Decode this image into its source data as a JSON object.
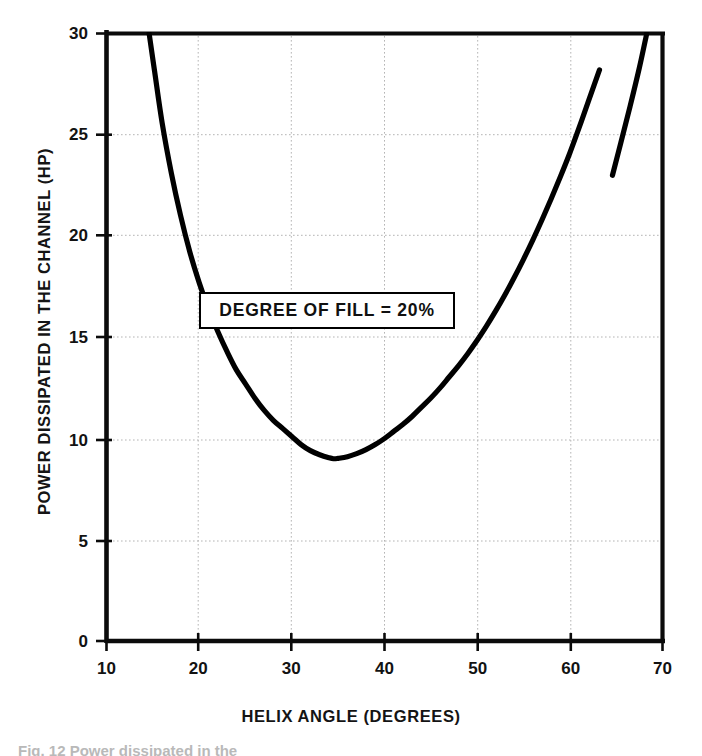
{
  "figure": {
    "caption_partial": "Fig. 12   Power dissipated in the"
  },
  "chart_data": {
    "type": "line",
    "title": "",
    "subtitle": "",
    "xlabel": "HELIX  ANGLE  (DEGREES)",
    "ylabel": "POWER DISSIPATED IN THE CHANNEL  (HP)",
    "xlim": [
      10,
      70
    ],
    "ylim": [
      0,
      30
    ],
    "xticks": [
      10,
      20,
      30,
      40,
      50,
      60,
      70
    ],
    "yticks": [
      0,
      5,
      10,
      15,
      20,
      25,
      30
    ],
    "xtick_labels": [
      "10",
      "20",
      "30",
      "40",
      "50",
      "60",
      "70"
    ],
    "ytick_labels": [
      "0",
      "5",
      "10",
      "15",
      "20",
      "25",
      "30"
    ],
    "grid": true,
    "grid_style": "dotted",
    "legend": null,
    "annotations": [
      {
        "text": "DEGREE OF FILL = 20%",
        "x": 34.5,
        "y": 16.3,
        "boxed": true
      }
    ],
    "series": [
      {
        "name": "Power dissipated (degree of fill 20%)",
        "color": "#000000",
        "line_width": 4,
        "has_break": true,
        "break_x_range": [
          63.2,
          64.6
        ],
        "x": [
          14.6,
          15.2,
          16.0,
          17.0,
          18.0,
          19.0,
          20.0,
          21.0,
          22.0,
          23.0,
          24.0,
          25.0,
          26.0,
          27.0,
          28.0,
          29.0,
          30.0,
          31.0,
          32.0,
          33.0,
          34.0,
          34.5,
          35.0,
          36.0,
          37.0,
          38.0,
          39.0,
          40.0,
          41.0,
          42.0,
          43.0,
          44.0,
          45.0,
          46.0,
          47.0,
          48.0,
          49.0,
          50.0,
          51.0,
          52.0,
          53.0,
          54.0,
          55.0,
          56.0,
          57.0,
          58.0,
          59.0,
          60.0,
          61.0,
          62.0,
          63.2,
          64.6,
          65.5,
          66.5,
          67.5,
          68.3
        ],
        "y": [
          30.0,
          28.1,
          25.6,
          23.1,
          21.0,
          19.2,
          17.7,
          16.4,
          15.3,
          14.3,
          13.4,
          12.7,
          12.0,
          11.4,
          10.9,
          10.5,
          10.1,
          9.7,
          9.4,
          9.2,
          9.05,
          9.0,
          9.02,
          9.1,
          9.25,
          9.45,
          9.7,
          10.0,
          10.35,
          10.7,
          11.1,
          11.55,
          12.0,
          12.5,
          13.05,
          13.6,
          14.2,
          14.85,
          15.55,
          16.3,
          17.1,
          17.95,
          18.85,
          19.8,
          20.8,
          21.85,
          22.95,
          24.1,
          25.35,
          26.65,
          28.2,
          23.0,
          24.6,
          26.4,
          28.3,
          30.0
        ]
      }
    ]
  },
  "axes": {
    "y_title": "POWER DISSIPATED IN THE CHANNEL  (HP)",
    "x_title": "HELIX  ANGLE  (DEGREES)"
  }
}
